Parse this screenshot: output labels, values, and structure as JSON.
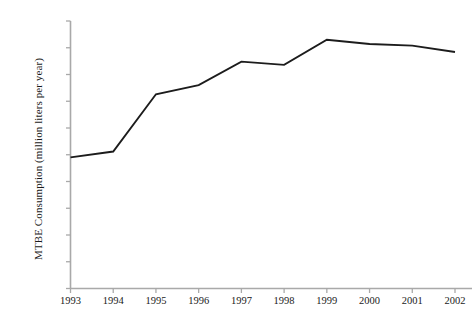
{
  "chart_data": {
    "type": "line",
    "title": "",
    "subtitle": "",
    "xlabel": "",
    "ylabel": "MTBE Consumption (million liters per year)",
    "categories": [
      "1993",
      "1994",
      "1995",
      "1996",
      "1997",
      "1998",
      "1999",
      "2000",
      "2001",
      "2002"
    ],
    "x": [
      1993,
      1994,
      1995,
      1996,
      1997,
      1998,
      1999,
      2000,
      2001,
      2002
    ],
    "values": [
      24500,
      25600,
      36300,
      38000,
      42400,
      41800,
      46500,
      45700,
      45400,
      44200
    ],
    "series": [
      {
        "name": "MTBE Consumption",
        "values": [
          24500,
          25600,
          36300,
          38000,
          42400,
          41800,
          46500,
          45700,
          45400,
          44200
        ]
      }
    ],
    "ylim": [
      0,
      50000
    ],
    "xlim": [
      1993,
      2002
    ],
    "y_ticks": [
      0,
      5000,
      10000,
      15000,
      20000,
      25000,
      30000,
      35000,
      40000,
      45000,
      50000
    ],
    "y_tick_labels": [
      "0",
      "5000",
      "10000",
      "15000",
      "20000",
      "25000",
      "30000",
      "35000",
      "40000",
      "45000",
      "50000"
    ],
    "x_ticks": [
      1993,
      1994,
      1995,
      1996,
      1997,
      1998,
      1999,
      2000,
      2001,
      2002
    ],
    "x_tick_labels": [
      "1993",
      "1994",
      "1995",
      "1996",
      "1997",
      "1998",
      "1999",
      "2000",
      "2001",
      "2002"
    ],
    "grid": false,
    "legend": false,
    "legend_position": "none",
    "line_color": "#1c1c1c",
    "axis_color": "#a9a9a9",
    "background_color": "#ffffff",
    "annotations": []
  },
  "axes": {
    "y_title": "MTBE Consumption (million liters per year)",
    "y_labels": [
      "50000",
      "45000",
      "40000",
      "35000",
      "30000",
      "25000",
      "20000",
      "15000",
      "10000",
      "5000",
      "0"
    ],
    "x_labels": [
      "1993",
      "1994",
      "1995",
      "1996",
      "1997",
      "1998",
      "1999",
      "2000",
      "2001",
      "2002"
    ]
  }
}
